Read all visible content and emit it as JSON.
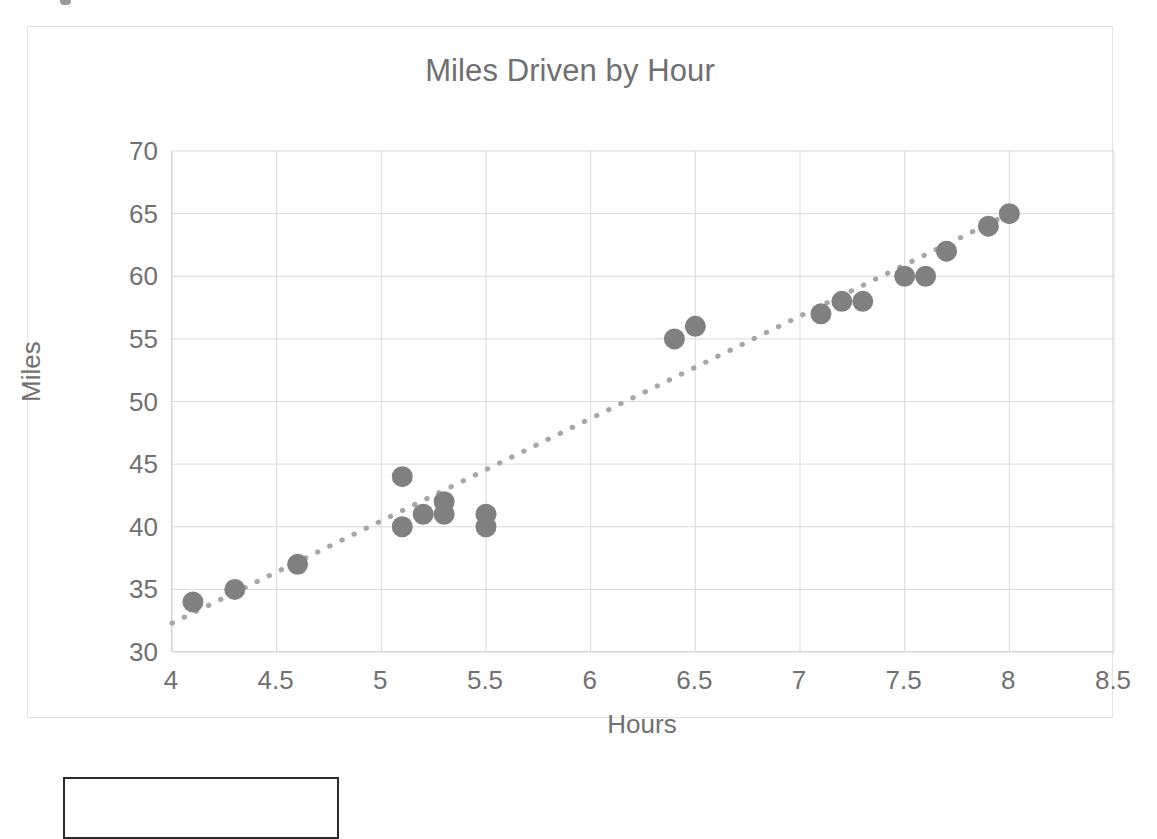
{
  "chart_data": {
    "type": "scatter",
    "title": "Miles Driven by Hour",
    "xlabel": "Hours",
    "ylabel": "Miles",
    "xlim": [
      4,
      8.5
    ],
    "ylim": [
      30,
      70
    ],
    "xticks": [
      "4",
      "4.5",
      "5",
      "5.5",
      "6",
      "6.5",
      "7",
      "7.5",
      "8",
      "8.5"
    ],
    "xtick_values": [
      4,
      4.5,
      5,
      5.5,
      6,
      6.5,
      7,
      7.5,
      8,
      8.5
    ],
    "yticks": [
      "30",
      "35",
      "40",
      "45",
      "50",
      "55",
      "60",
      "65",
      "70"
    ],
    "ytick_values": [
      30,
      35,
      40,
      45,
      50,
      55,
      60,
      65,
      70
    ],
    "grid": true,
    "legend": false,
    "marker_color": "#808080",
    "gridline_color": "#d9d9d9",
    "text_color": "#707070",
    "x": [
      4.1,
      4.3,
      4.6,
      5.1,
      5.1,
      5.2,
      5.3,
      5.3,
      5.5,
      5.5,
      6.4,
      6.5,
      7.1,
      7.2,
      7.3,
      7.5,
      7.6,
      7.7,
      7.9,
      8.0
    ],
    "y": [
      34,
      35,
      37,
      44,
      40,
      41,
      42,
      41,
      41,
      40,
      55,
      56,
      57,
      58,
      58,
      60,
      60,
      62,
      64,
      65
    ],
    "points": [
      {
        "x": 4.1,
        "y": 34
      },
      {
        "x": 4.3,
        "y": 35
      },
      {
        "x": 4.6,
        "y": 37
      },
      {
        "x": 5.1,
        "y": 44
      },
      {
        "x": 5.1,
        "y": 40
      },
      {
        "x": 5.2,
        "y": 41
      },
      {
        "x": 5.3,
        "y": 42
      },
      {
        "x": 5.3,
        "y": 41
      },
      {
        "x": 5.5,
        "y": 41
      },
      {
        "x": 5.5,
        "y": 40
      },
      {
        "x": 6.4,
        "y": 55
      },
      {
        "x": 6.5,
        "y": 56
      },
      {
        "x": 7.1,
        "y": 57
      },
      {
        "x": 7.2,
        "y": 58
      },
      {
        "x": 7.3,
        "y": 58
      },
      {
        "x": 7.5,
        "y": 60
      },
      {
        "x": 7.6,
        "y": 60
      },
      {
        "x": 7.7,
        "y": 62
      },
      {
        "x": 7.9,
        "y": 64
      },
      {
        "x": 8.0,
        "y": 65
      }
    ],
    "trendline": {
      "style": "dotted",
      "color": "#a6a6a6",
      "x_start": 4.0,
      "y_start": 32.3,
      "x_end": 8.05,
      "y_end": 65.4
    }
  }
}
